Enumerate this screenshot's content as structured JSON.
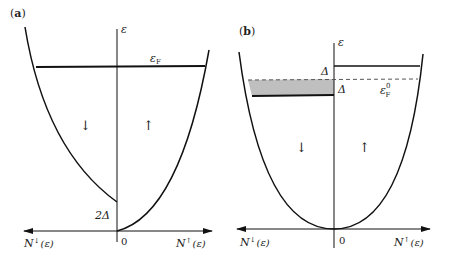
{
  "panel_a": {
    "label_open": "(",
    "label_letter": "a",
    "label_close": ")",
    "energy_axis_label": "ε",
    "fermi_label_main": "ε",
    "fermi_label_sub": "F",
    "down_spin_symbol": "↓",
    "up_spin_symbol": "↑",
    "gap_label": "2Δ",
    "origin_label": "0",
    "left_axis_label_N": "N",
    "left_axis_label_spin": "↓",
    "left_axis_label_arg": "(ε)",
    "right_axis_label_N": "N",
    "right_axis_label_spin": "↑",
    "right_axis_label_arg": "(ε)"
  },
  "panel_b": {
    "label_open": "(",
    "label_letter": "b",
    "label_close": ")",
    "energy_axis_label": "ε",
    "delta_upper_label": "Δ",
    "delta_lower_label": "Δ",
    "fermi0_label_main": "ε",
    "fermi0_label_sup": "0",
    "fermi0_label_sub": "F",
    "down_spin_symbol": "↓",
    "up_spin_symbol": "↑",
    "origin_label": "0",
    "left_axis_label_N": "N",
    "left_axis_label_spin": "↓",
    "left_axis_label_arg": "(ε)",
    "right_axis_label_N": "N",
    "right_axis_label_spin": "↑",
    "right_axis_label_arg": "(ε)"
  },
  "colors": {
    "line": "#111111",
    "shade": "#bfbfbf",
    "dash": "#666666"
  }
}
